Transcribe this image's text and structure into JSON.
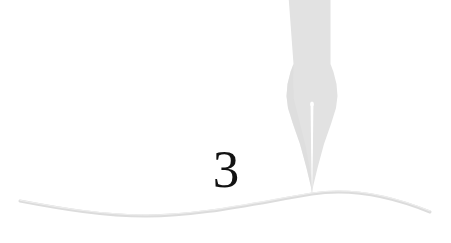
{
  "page": {
    "width": 451,
    "height": 243,
    "background_color": "#ffffff"
  },
  "chapter": {
    "number": "3",
    "number_color": "#121212",
    "number_font_size_px": 53
  },
  "ornaments": {
    "pen_nib": {
      "name": "fountain-pen-nib",
      "description": "Downward pointing fountain pen nib with central slit and breather hole",
      "fill_color": "#e2e2e2",
      "slit_color": "#ffffff",
      "tip_x": 312,
      "tip_y": 194,
      "shaft_top_y": 0,
      "shaft_left_x": 288,
      "shaft_right_x": 331,
      "shoulder_y": 78,
      "widest_left_x": 282,
      "widest_right_x": 337,
      "widest_y": 98
    },
    "wave_rule": {
      "name": "wavy-baseline-rule",
      "description": "Soft S-curve horizontal rule beneath the chapter number",
      "stroke_color": "#dcdcdc",
      "stroke_width_px": 3,
      "start_x": 20,
      "start_y": 201,
      "end_x": 430,
      "end_y": 212,
      "trough_x": 140,
      "trough_y": 216,
      "crest_x": 312,
      "crest_y": 194
    }
  },
  "icon_names": {
    "nib": "pen-nib-icon",
    "wave": "wave-rule-icon"
  }
}
